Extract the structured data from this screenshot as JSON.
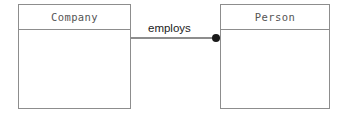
{
  "diagram": {
    "type": "uml-class-diagram",
    "background_color": "#ffffff",
    "border_color": "#8d8d8d",
    "text_color": "#555555",
    "label_color": "#1b1b1b",
    "classes": [
      {
        "name": "Company",
        "attributes": [],
        "operations": []
      },
      {
        "name": "Person",
        "attributes": [],
        "operations": []
      }
    ],
    "associations": [
      {
        "label": "employs",
        "source": "Company",
        "target": "Person",
        "target_end_marker": "filled-circle",
        "marker_color": "#1a1a1a"
      }
    ]
  }
}
